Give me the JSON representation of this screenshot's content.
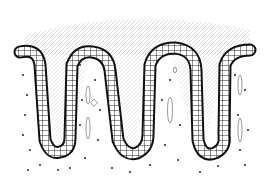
{
  "image": {
    "subject": "histological drawing of folded epithelium (crypts/villi) with columnar cell layer",
    "style": "black ink line drawing on white",
    "colors": {
      "background": "#ffffff",
      "ink": "#111111",
      "stroma_dots": "#222222",
      "hatching": "#999999"
    },
    "folds": 4
  }
}
